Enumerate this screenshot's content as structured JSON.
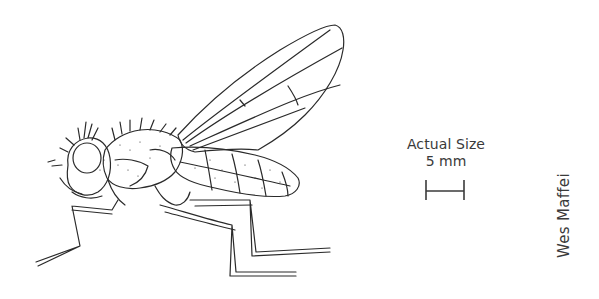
{
  "illustration": {
    "subject": "fly",
    "description": "Line drawing of a fly in side profile with wings raised"
  },
  "scale": {
    "title": "Actual Size",
    "value": "5 mm"
  },
  "credit": {
    "artist": "Wes Maffei"
  },
  "colors": {
    "ink": "#2a2a2a",
    "text": "#3a3a3a",
    "background": "#ffffff"
  }
}
